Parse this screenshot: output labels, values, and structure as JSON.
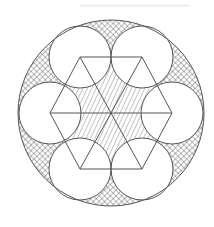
{
  "figure": {
    "title": "",
    "outer_circle": {
      "cx": 111,
      "cy": 113,
      "r": 93
    },
    "hexagon": {
      "cx": 111,
      "cy": 113,
      "circumradius": 61
    },
    "inner_circles": {
      "count": 6,
      "r": 31,
      "centers": [
        [
          80,
          57
        ],
        [
          142,
          57
        ],
        [
          172,
          113
        ],
        [
          142,
          169
        ],
        [
          80,
          169
        ],
        [
          50,
          113
        ]
      ]
    },
    "regions": {
      "outer_gaps": {
        "fill": "crosshatch",
        "color": "#555555"
      },
      "center_star": {
        "fill": "diagonal-hatch",
        "color": "#555555"
      }
    },
    "stroke_color": "#555555",
    "background": "#ffffff"
  }
}
